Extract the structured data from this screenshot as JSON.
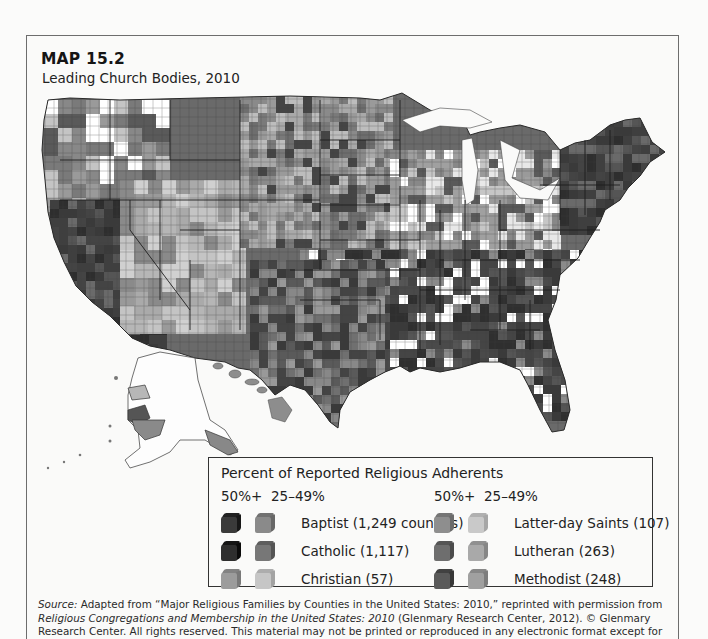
{
  "header": {
    "label": "MAP 15.2",
    "title": "Leading Church Bodies, 2010"
  },
  "legend": {
    "title": "Percent of Reported Religious Adherents",
    "col_headers": {
      "high": "50%+",
      "mid": "25–49%"
    },
    "items": [
      {
        "name": "Baptist (1,249 counties)",
        "high": "#3a3a3a",
        "mid": "#8a8a8a",
        "col": 0,
        "row": 0
      },
      {
        "name": "Catholic (1,117)",
        "high": "#2e2e2e",
        "mid": "#777777",
        "col": 0,
        "row": 1
      },
      {
        "name": "Christian (57)",
        "high": "#9c9c9c",
        "mid": "#c6c6c6",
        "col": 0,
        "row": 2
      },
      {
        "name": "Latter-day Saints (107)",
        "high": "#8e8e8e",
        "mid": "#c9c9c9",
        "col": 1,
        "row": 0
      },
      {
        "name": "Lutheran (263)",
        "high": "#6e6e6e",
        "mid": "#a9a9a9",
        "col": 1,
        "row": 1
      },
      {
        "name": "Methodist (248)",
        "high": "#5a5a5a",
        "mid": "#a0a0a0",
        "col": 1,
        "row": 2
      }
    ]
  },
  "source": {
    "prefix": "Source:",
    "text1": " Adapted from “Major Religious Families by Counties in the United States: 2010,” reprinted with permission from ",
    "italic1": "Religious Congregations and Membership in the United States: 2010",
    "text2": " (Glenmary Research Center, 2012). © Glenmary Research Center. All rights reserved. This material may not be printed or reproduced in any electronic format except for individual use and may not be distributed for profit."
  },
  "map": {
    "regions": [
      {
        "name": "pacific-northwest",
        "tone": "mixed-light",
        "bbox": [
          44,
          100,
          165,
          200
        ]
      },
      {
        "name": "california",
        "tone": "catholic",
        "bbox": [
          50,
          200,
          160,
          345
        ]
      },
      {
        "name": "great-basin-mountain",
        "tone": "lds",
        "bbox": [
          120,
          180,
          240,
          330
        ]
      },
      {
        "name": "northern-plains",
        "tone": "lutheran-catholic",
        "bbox": [
          240,
          95,
          390,
          240
        ]
      },
      {
        "name": "midwest",
        "tone": "methodist-mixed",
        "bbox": [
          390,
          150,
          560,
          260
        ]
      },
      {
        "name": "northeast",
        "tone": "catholic",
        "bbox": [
          560,
          100,
          670,
          230
        ]
      },
      {
        "name": "south",
        "tone": "baptist",
        "bbox": [
          300,
          250,
          600,
          420
        ]
      },
      {
        "name": "texas",
        "tone": "baptist-catholic",
        "bbox": [
          250,
          260,
          380,
          440
        ]
      },
      {
        "name": "alaska",
        "tone": "light",
        "bbox": [
          95,
          350,
          200,
          465
        ]
      },
      {
        "name": "hawaii",
        "tone": "mid",
        "bbox": [
          210,
          365,
          300,
          420
        ]
      }
    ]
  }
}
